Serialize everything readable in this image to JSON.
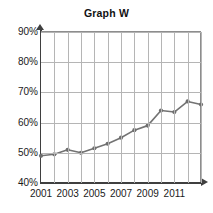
{
  "chart_data": {
    "type": "line",
    "title": "Graph W",
    "xlabel": "",
    "ylabel": "",
    "x": [
      2001,
      2002,
      2003,
      2004,
      2005,
      2006,
      2007,
      2008,
      2009,
      2010,
      2011,
      2012,
      2013
    ],
    "values": [
      49,
      49.5,
      51,
      50,
      51.5,
      53,
      55,
      57.5,
      59,
      64,
      63.5,
      67,
      66
    ],
    "series": [
      {
        "name": "Graph W",
        "values": [
          49,
          49.5,
          51,
          50,
          51.5,
          53,
          55,
          57.5,
          59,
          64,
          63.5,
          67,
          66
        ]
      }
    ],
    "ylim": [
      40,
      90
    ],
    "xlim": [
      2001,
      2013
    ],
    "y_ticks": [
      40,
      50,
      60,
      70,
      80,
      90
    ],
    "y_tick_labels": [
      "40%",
      "50%",
      "60%",
      "70%",
      "80%",
      "90%"
    ],
    "x_ticks": [
      2001,
      2003,
      2005,
      2007,
      2009,
      2011
    ],
    "x_tick_labels": [
      "2001",
      "2003",
      "2005",
      "2007",
      "2009",
      "2011"
    ],
    "grid": true,
    "legend": "none",
    "line_color": "#737373",
    "marker_color": "#6e6e6e",
    "grid_color": "#b5b5b5",
    "axis_color": "#3f3f3f"
  },
  "corner": {
    "watermark": ""
  }
}
